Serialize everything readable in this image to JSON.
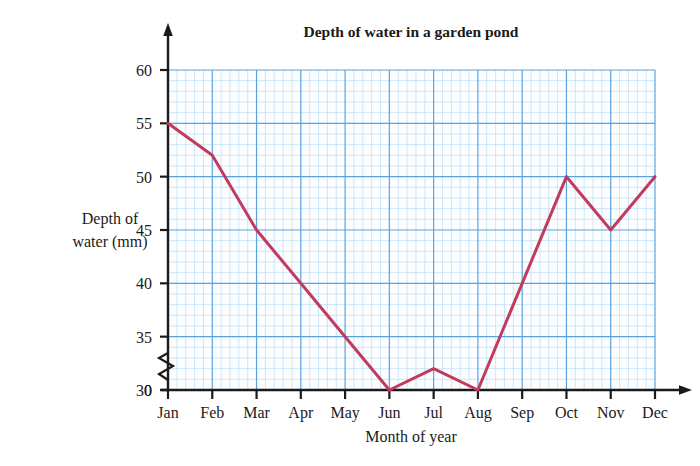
{
  "chart_data": {
    "type": "line",
    "title": "Depth of water in a garden pond",
    "xlabel": "Month of year",
    "ylabel": "Depth of water (mm)",
    "ylabel_line1": "Depth of",
    "ylabel_line2": "water (mm)",
    "categories": [
      "Jan",
      "Feb",
      "Mar",
      "Apr",
      "May",
      "Jun",
      "Jul",
      "Aug",
      "Sep",
      "Oct",
      "Nov",
      "Dec"
    ],
    "values": [
      55,
      52,
      45,
      40,
      35,
      30,
      32,
      30,
      40,
      50,
      45,
      50
    ],
    "ylim": [
      30,
      60
    ],
    "yticks": [
      30,
      35,
      40,
      45,
      50,
      55,
      60
    ],
    "ytick_labels": [
      "30",
      "35",
      "40",
      "45",
      "50",
      "55",
      "60"
    ],
    "y_origin_label": "0",
    "axis_break": true,
    "grid": true,
    "minor_grid": true,
    "minor_per_major": 5,
    "legend": "none",
    "series_color": "#c23a5c",
    "major_grid_color": "#5ba3e0",
    "minor_grid_color": "#b9dcf5",
    "plot_bg_color": "#fbfdff",
    "axis_color": "#1a1a1a"
  },
  "canvas": {
    "plot_left": 168,
    "plot_right": 655,
    "plot_top": 70,
    "plot_bottom": 390
  }
}
